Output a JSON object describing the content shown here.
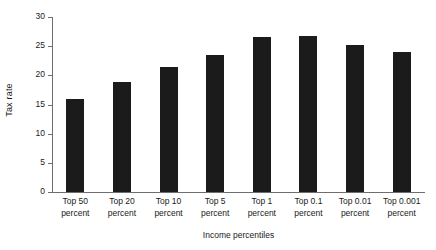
{
  "chart_data": {
    "type": "bar",
    "title": "",
    "xlabel": "Income percentiles",
    "ylabel": "Tax rate",
    "categories": [
      "Top 50 percent",
      "Top 20 percent",
      "Top 10 percent",
      "Top 5 percent",
      "Top 1 percent",
      "Top 0.1 percent",
      "Top 0.01 percent",
      "Top 0.001 percent"
    ],
    "category_lines": [
      [
        "Top 50",
        "percent"
      ],
      [
        "Top 20",
        "percent"
      ],
      [
        "Top 10",
        "percent"
      ],
      [
        "Top 5",
        "percent"
      ],
      [
        "Top 1",
        "percent"
      ],
      [
        "Top 0.1",
        "percent"
      ],
      [
        "Top 0.01",
        "percent"
      ],
      [
        "Top 0.001",
        "percent"
      ]
    ],
    "values": [
      15.9,
      18.9,
      21.4,
      23.5,
      26.6,
      26.7,
      25.2,
      24.0
    ],
    "ylim": [
      0,
      30
    ],
    "yticks": [
      0,
      5,
      10,
      15,
      20,
      25,
      30
    ],
    "ytick_labels": [
      "0",
      "5",
      "10",
      "15",
      "20",
      "25",
      "30"
    ],
    "grid": false,
    "legend": "none",
    "bar_color": "#1b1b1b",
    "axis_color": "#6e6e6e",
    "background_color": "#ffffff"
  }
}
